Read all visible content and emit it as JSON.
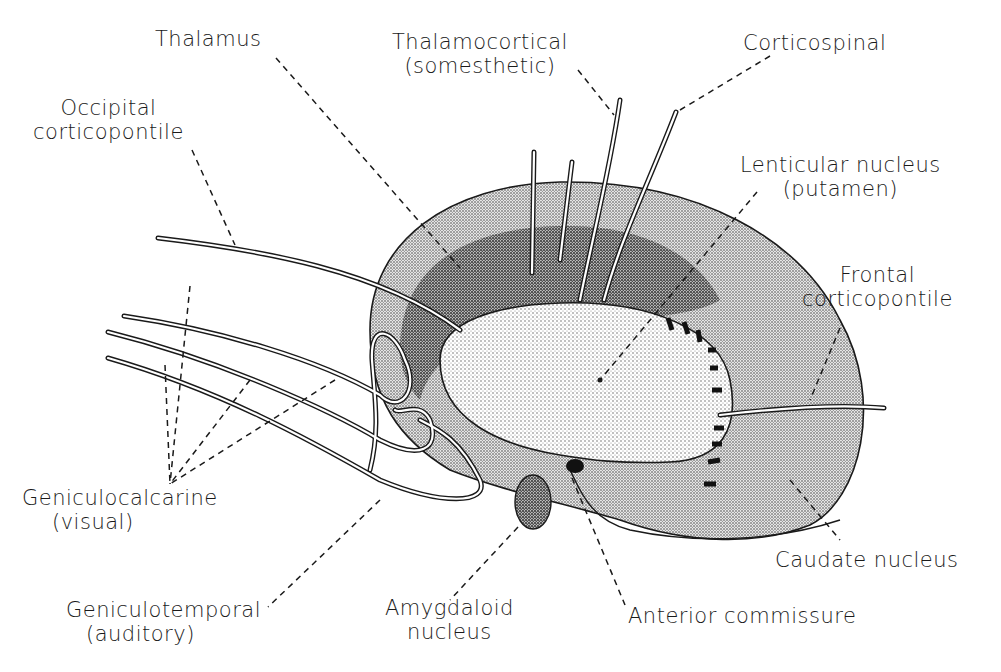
{
  "diagram": {
    "colors": {
      "ink": "#1a1a1a",
      "background": "#ffffff",
      "stipple_light": "#cfcfcf",
      "stipple_dark": "#8a8a8a"
    },
    "labels": {
      "thalamus": "Thalamus",
      "thalamocortical_1": "Thalamocortical",
      "thalamocortical_2": "(somesthetic)",
      "corticospinal": "Corticospinal",
      "occipital_1": "Occipital",
      "occipital_2": "corticopontile",
      "lenticular_1": "Lenticular nucleus",
      "lenticular_2": "(putamen)",
      "frontal_1": "Frontal",
      "frontal_2": "corticopontile",
      "geniculocalcarine_1": "Geniculocalcarine",
      "geniculocalcarine_2": "(visual)",
      "geniculotemporal_1": "Geniculotemporal",
      "geniculotemporal_2": "(auditory)",
      "amygdaloid_1": "Amygdaloid",
      "amygdaloid_2": "nucleus",
      "anterior_commissure": "Anterior commissure",
      "caudate": "Caudate nucleus"
    }
  }
}
